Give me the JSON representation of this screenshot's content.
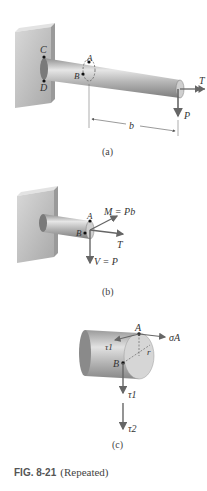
{
  "figure": {
    "number": "FIG. 8-21",
    "note": "(Repeated)"
  },
  "panels": [
    {
      "id": "a",
      "caption": "(a)",
      "labels": {
        "C": "C",
        "D": "D",
        "A": "A",
        "B": "B",
        "T": "T",
        "P": "P",
        "b": "b"
      }
    },
    {
      "id": "b",
      "caption": "(b)",
      "labels": {
        "A": "A",
        "B": "B",
        "M": "M = Pb",
        "T": "T",
        "V": "V = P"
      }
    },
    {
      "id": "c",
      "caption": "(c)",
      "labels": {
        "A": "A",
        "B": "B",
        "sigma": "σA",
        "tau1_top": "τ1",
        "r": "r",
        "tau1": "τ1",
        "tau2": "τ2"
      }
    }
  ],
  "colors": {
    "wall": "#c8c8c8",
    "shaft": "#b8b8b8",
    "arrow": "#666666",
    "text": "#333333"
  }
}
